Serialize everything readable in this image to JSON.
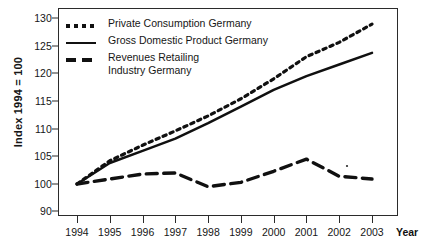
{
  "axes": {
    "y_title": "Index 1994 = 100",
    "y_ticks": [
      "130",
      "125",
      "120",
      "115",
      "110",
      "105",
      "100",
      "90"
    ],
    "x_ticks": [
      "1994",
      "1995",
      "1996",
      "1997",
      "1998",
      "1999",
      "2000",
      "2001",
      "2002",
      "2003"
    ],
    "x_title": "Year"
  },
  "legend": {
    "items": [
      {
        "label": "Private Consumption Germany",
        "style": "dotted"
      },
      {
        "label": "Gross Domestic Product Germany",
        "style": "solid"
      },
      {
        "label": "Revenues Retailing\nIndustry Germany",
        "style": "dashed"
      }
    ]
  },
  "chart_data": {
    "type": "line",
    "title": "",
    "xlabel": "Year",
    "ylabel": "Index 1994 = 100",
    "x": [
      1994,
      1995,
      1996,
      1997,
      1998,
      1999,
      2000,
      2001,
      2002,
      2003
    ],
    "ylim": [
      90,
      130
    ],
    "y_tick_values": [
      130,
      125,
      120,
      115,
      110,
      105,
      100,
      90
    ],
    "axis_break_between": [
      100,
      90
    ],
    "grid": false,
    "legend_position": "upper-left-inside",
    "series": [
      {
        "name": "Private Consumption Germany",
        "style": "dotted",
        "values": [
          100.0,
          104.2,
          107.0,
          109.6,
          112.3,
          115.4,
          119.0,
          123.0,
          125.6,
          128.9
        ]
      },
      {
        "name": "Gross Domestic Product Germany",
        "style": "solid",
        "values": [
          100.0,
          103.8,
          106.0,
          108.2,
          111.0,
          114.0,
          117.0,
          119.5,
          121.6,
          123.7
        ]
      },
      {
        "name": "Revenues Retailing Industry Germany",
        "style": "dashed",
        "values": [
          100.0,
          100.9,
          101.8,
          102.0,
          99.0,
          100.3,
          102.3,
          104.5,
          101.4,
          100.9
        ]
      }
    ]
  }
}
